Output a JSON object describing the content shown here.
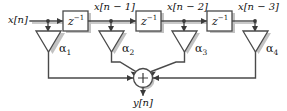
{
  "diagram": {
    "type": "signal-flow-diagram",
    "colors": {
      "line": "#4a4a4a",
      "shadow": "#c2c2c2",
      "text": "#111111",
      "background": "#ffffff"
    },
    "input": {
      "label": "x[n]"
    },
    "output": {
      "label": "y[n]"
    },
    "taps": [
      {
        "label": "x[n]",
        "coefficient": "α",
        "coefficient_index": "1"
      },
      {
        "label": "x[n − 1]",
        "coefficient": "α",
        "coefficient_index": "2"
      },
      {
        "label": "x[n − 2]",
        "coefficient": "α",
        "coefficient_index": "3"
      },
      {
        "label": "x[n − 3]",
        "coefficient": "α",
        "coefficient_index": "4"
      }
    ],
    "delay_blocks": [
      {
        "label": "z",
        "exponent": "−1"
      },
      {
        "label": "z",
        "exponent": "−1"
      },
      {
        "label": "z",
        "exponent": "−1"
      }
    ],
    "summing_node": {
      "symbol": "+"
    },
    "signal_labels": {
      "x_n": "x[n]",
      "x_n_1": "x[n − 1]",
      "x_n_2": "x[n − 2]",
      "x_n_3": "x[n − 3]",
      "y_n": "y[n]"
    },
    "coefficient_labels": {
      "a1": "α",
      "a1_sub": "1",
      "a2": "α",
      "a2_sub": "2",
      "a3": "α",
      "a3_sub": "3",
      "a4": "α",
      "a4_sub": "4"
    },
    "delay_label": {
      "base": "z",
      "exp": "−1"
    }
  }
}
